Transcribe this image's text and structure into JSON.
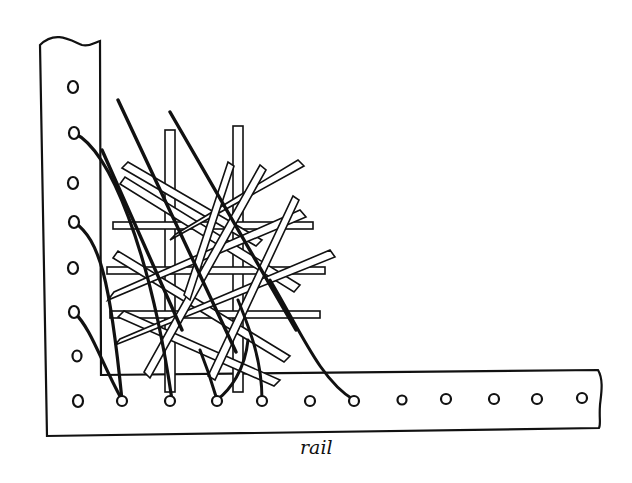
{
  "figure": {
    "caption": "rail",
    "colors": {
      "ink": "#111111",
      "paper": "#ffffff"
    },
    "left_rail_holes": 7,
    "bottom_rail_holes": 12
  }
}
